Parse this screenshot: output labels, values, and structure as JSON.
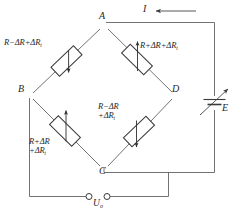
{
  "figure": {
    "type": "circuit-diagram",
    "name": "Wheatstone bridge strain gauge circuit",
    "background_color": "#ffffff",
    "line_color": "#555555",
    "text_color": "#262626"
  },
  "nodes": [
    {
      "id": "A",
      "label": "A",
      "x": 104,
      "y": 24,
      "role": "bridge-top-node"
    },
    {
      "id": "B",
      "label": "B",
      "x": 26,
      "y": 96,
      "role": "bridge-left-node"
    },
    {
      "id": "C",
      "label": "C",
      "x": 104,
      "y": 170,
      "role": "bridge-bottom-node"
    },
    {
      "id": "D",
      "label": "D",
      "x": 176,
      "y": 96,
      "role": "bridge-right-node"
    }
  ],
  "resistors": [
    {
      "id": "R1",
      "position": "top-left",
      "branch": "A-B",
      "arrow": "down",
      "label_lines": [
        "R−ΔR+ΔR"
      ],
      "label_sub": "t",
      "label_plain": "R−ΔR+ΔRₜ"
    },
    {
      "id": "R2",
      "position": "top-right",
      "branch": "A-D",
      "arrow": "up",
      "label_lines": [
        "R+ΔR+ΔR"
      ],
      "label_sub": "t",
      "label_plain": "R+ΔR+ΔRₜ"
    },
    {
      "id": "R3",
      "position": "bottom-left",
      "branch": "B-C",
      "arrow": "up",
      "label_lines": [
        "R+ΔR",
        "+ΔR"
      ],
      "label_sub": "t",
      "label_plain": "R+ΔR +ΔRₜ"
    },
    {
      "id": "R4",
      "position": "bottom-right",
      "branch": "D-C",
      "arrow": "down",
      "label_lines": [
        "R−ΔR",
        "+ΔR"
      ],
      "label_sub": "t",
      "label_plain": "R−ΔR +ΔRₜ"
    }
  ],
  "current": {
    "label": "I",
    "direction": "leftward",
    "arrow_glyph": "←"
  },
  "source": {
    "id": "E",
    "label": "E",
    "type": "adjustable-voltage-source",
    "adjustable": true
  },
  "output": {
    "label_main": "U",
    "label_sub": "o",
    "label_plain": "Uₒ",
    "terminal_count": 2,
    "terminal_shape": "circle"
  }
}
